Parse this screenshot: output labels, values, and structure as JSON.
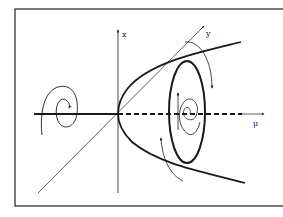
{
  "figure": {
    "type": "hopf-bifurcation-diagram",
    "axes": {
      "x_label": "x",
      "y_label": "y",
      "mu_label": "μ"
    },
    "colors": {
      "ink": "#1a1a1a",
      "background": "#ffffff",
      "frame": "#222222"
    }
  }
}
